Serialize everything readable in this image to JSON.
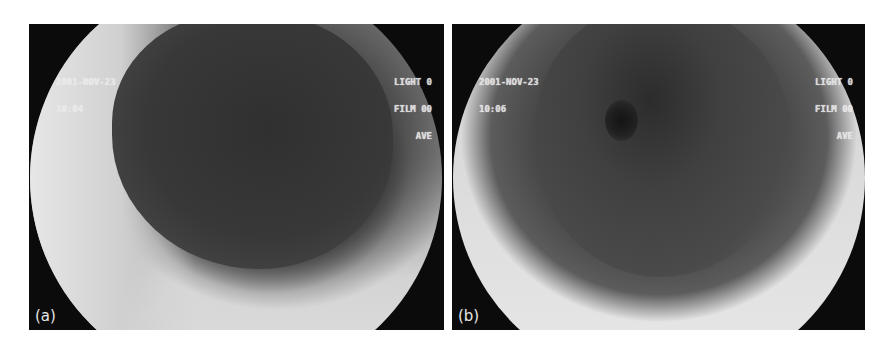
{
  "figure": {
    "panels": [
      {
        "label": "(a)",
        "osd": {
          "date": "2001-NOV-23",
          "time": "10:04",
          "light": "LIGHT 0",
          "film": "FILM 00",
          "mode": "AVE"
        }
      },
      {
        "label": "(b)",
        "osd": {
          "date": "2001-NOV-23",
          "time": "10:06",
          "light": "LIGHT 0",
          "film": "FILM 00",
          "mode": "AVE"
        }
      }
    ]
  }
}
